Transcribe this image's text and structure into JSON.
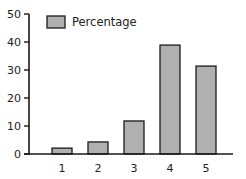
{
  "chart_data": {
    "type": "bar",
    "title": "",
    "xlabel": "",
    "ylabel": "",
    "categories": [
      "1",
      "2",
      "3",
      "4",
      "5"
    ],
    "series": [
      {
        "name": "Percentage",
        "values": [
          2.1,
          4.3,
          11.8,
          38.9,
          31.4
        ]
      }
    ],
    "ylim": [
      0,
      50
    ],
    "yticks": [
      0,
      10,
      20,
      30,
      40,
      50
    ],
    "grid": false,
    "legend_position": "upper left",
    "colors": {
      "bar_fill": "#b0b0b0",
      "bar_stroke": "#1a1a1a",
      "axis": "#1a1a1a"
    }
  }
}
